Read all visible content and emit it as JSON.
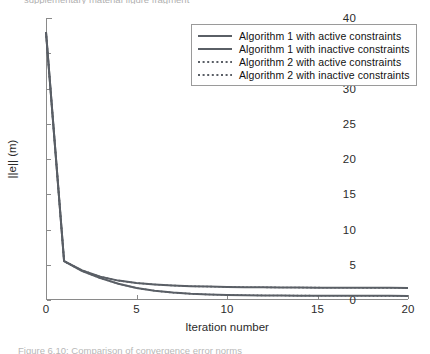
{
  "figure": {
    "clipped_header_text": "supplementary material figure fragment",
    "clipped_caption_text": "Figure 6.10:  Comparison of convergence error norms"
  },
  "axes": {
    "ylabel": "||e|| (m)",
    "xlabel": "Iteration number",
    "yticks": [
      "0",
      "5",
      "10",
      "15",
      "20",
      "25",
      "30",
      "35",
      "40"
    ],
    "xticks": [
      "0",
      "5",
      "10",
      "15",
      "20"
    ]
  },
  "legend": {
    "items": [
      {
        "label": "Algorithm 1 with active constraints",
        "style": "solid",
        "color": "#5a5f66"
      },
      {
        "label": "Algorithm 1 with inactive constraints",
        "style": "solid",
        "color": "#5a5f66"
      },
      {
        "label": "Algorithm 2 with active constraints",
        "style": "dotted",
        "color": "#5a5f66"
      },
      {
        "label": "Algorithm 2 with inactive constraints",
        "style": "dotted",
        "color": "#5a5f66"
      }
    ]
  },
  "chart_data": {
    "type": "line",
    "title": "",
    "xlabel": "Iteration number",
    "ylabel": "||e|| (m)",
    "xlim": [
      0,
      20
    ],
    "ylim": [
      0,
      40
    ],
    "xticks": [
      0,
      5,
      10,
      15,
      20
    ],
    "yticks": [
      0,
      5,
      10,
      15,
      20,
      25,
      30,
      35,
      40
    ],
    "grid": false,
    "legend_position": "upper right",
    "x": [
      0,
      1,
      2,
      3,
      4,
      5,
      6,
      7,
      8,
      9,
      10,
      11,
      12,
      13,
      14,
      15,
      16,
      17,
      18,
      19,
      20
    ],
    "series": [
      {
        "name": "Algorithm 1 with active constraints",
        "style": "solid",
        "color": "#5a5f66",
        "values": [
          38.0,
          5.5,
          4.2,
          3.3,
          2.75,
          2.4,
          2.2,
          2.05,
          1.95,
          1.9,
          1.85,
          1.82,
          1.8,
          1.78,
          1.76,
          1.75,
          1.74,
          1.73,
          1.72,
          1.72,
          1.71
        ]
      },
      {
        "name": "Algorithm 1 with inactive constraints",
        "style": "solid",
        "color": "#5a5f66",
        "values": [
          38.0,
          5.5,
          4.1,
          3.1,
          2.3,
          1.7,
          1.3,
          1.05,
          0.88,
          0.78,
          0.72,
          0.68,
          0.65,
          0.63,
          0.62,
          0.61,
          0.6,
          0.6,
          0.59,
          0.59,
          0.58
        ]
      },
      {
        "name": "Algorithm 2 with active constraints",
        "style": "dotted",
        "color": "#5a5f66",
        "values": [
          38.0,
          5.5,
          4.2,
          3.3,
          2.75,
          2.4,
          2.2,
          2.05,
          1.95,
          1.9,
          1.85,
          1.82,
          1.8,
          1.78,
          1.76,
          1.75,
          1.74,
          1.73,
          1.72,
          1.72,
          1.71
        ]
      },
      {
        "name": "Algorithm 2 with inactive constraints",
        "style": "dotted",
        "color": "#5a5f66",
        "values": [
          38.0,
          5.5,
          4.1,
          3.1,
          2.3,
          1.7,
          1.3,
          1.05,
          0.88,
          0.78,
          0.72,
          0.68,
          0.65,
          0.63,
          0.62,
          0.61,
          0.6,
          0.6,
          0.59,
          0.59,
          0.58
        ]
      }
    ]
  }
}
